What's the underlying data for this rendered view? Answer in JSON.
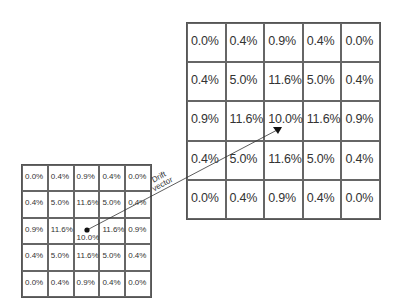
{
  "big_grid": {
    "rows": [
      [
        "0.0%",
        "0.4%",
        "0.9%",
        "0.4%",
        "0.0%"
      ],
      [
        "0.4%",
        "5.0%",
        "11.6%",
        "5.0%",
        "0.4%"
      ],
      [
        "0.9%",
        "11.6%",
        "10.0%",
        "11.6%",
        "0.9%"
      ],
      [
        "0.4%",
        "5.0%",
        "11.6%",
        "5.0%",
        "0.4%"
      ],
      [
        "0.0%",
        "0.4%",
        "0.9%",
        "0.4%",
        "0.0%"
      ]
    ]
  },
  "small_grid": {
    "rows": [
      [
        "0.0%",
        "0.4%",
        "0.9%",
        "0.4%",
        "0.0%"
      ],
      [
        "0.4%",
        "5.0%",
        "11.6%",
        "5.0%",
        "0.4%"
      ],
      [
        "0.9%",
        "11.6%",
        "10.0%",
        "11.6%",
        "0.9%"
      ],
      [
        "0.4%",
        "5.0%",
        "11.6%",
        "5.0%",
        "0.4%"
      ],
      [
        "0.0%",
        "0.4%",
        "0.9%",
        "0.4%",
        "0.0%"
      ]
    ]
  },
  "arrow": {
    "label_line1": "Drift",
    "label_line2": "vector"
  }
}
